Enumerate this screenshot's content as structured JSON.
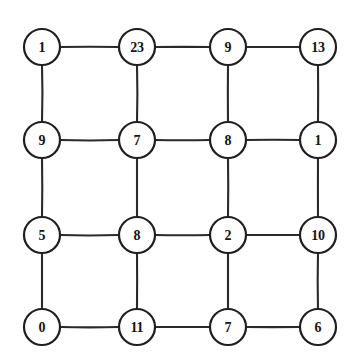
{
  "figure": {
    "type": "grid-graph",
    "title": "",
    "background_color": "#ffffff",
    "node_stroke_color": "#1f1f1f",
    "node_fill_color": "#ffffff",
    "edge_color": "#2a2a2a",
    "label_color": "#141414",
    "rows": 4,
    "columns": 4,
    "node_radius": 18,
    "column_x": [
      42,
      137,
      228,
      318
    ],
    "row_y": [
      47,
      140,
      235,
      327
    ]
  },
  "graph_data": {
    "type": "lattice",
    "node_count": 16,
    "edge_count": 24,
    "nodes": [
      {
        "id": "n-0-0",
        "row": 0,
        "col": 0,
        "label": "1",
        "cx": 42,
        "cy": 47
      },
      {
        "id": "n-0-1",
        "row": 0,
        "col": 1,
        "label": "23",
        "cx": 137,
        "cy": 47
      },
      {
        "id": "n-0-2",
        "row": 0,
        "col": 2,
        "label": "9",
        "cx": 228,
        "cy": 47
      },
      {
        "id": "n-0-3",
        "row": 0,
        "col": 3,
        "label": "13",
        "cx": 318,
        "cy": 47
      },
      {
        "id": "n-1-0",
        "row": 1,
        "col": 0,
        "label": "9",
        "cx": 42,
        "cy": 140
      },
      {
        "id": "n-1-1",
        "row": 1,
        "col": 1,
        "label": "7",
        "cx": 137,
        "cy": 140
      },
      {
        "id": "n-1-2",
        "row": 1,
        "col": 2,
        "label": "8",
        "cx": 228,
        "cy": 140
      },
      {
        "id": "n-1-3",
        "row": 1,
        "col": 3,
        "label": "1",
        "cx": 318,
        "cy": 140
      },
      {
        "id": "n-2-0",
        "row": 2,
        "col": 0,
        "label": "5",
        "cx": 42,
        "cy": 235
      },
      {
        "id": "n-2-1",
        "row": 2,
        "col": 1,
        "label": "8",
        "cx": 137,
        "cy": 235
      },
      {
        "id": "n-2-2",
        "row": 2,
        "col": 2,
        "label": "2",
        "cx": 228,
        "cy": 235
      },
      {
        "id": "n-2-3",
        "row": 2,
        "col": 3,
        "label": "10",
        "cx": 318,
        "cy": 235
      },
      {
        "id": "n-3-0",
        "row": 3,
        "col": 0,
        "label": "0",
        "cx": 42,
        "cy": 327
      },
      {
        "id": "n-3-1",
        "row": 3,
        "col": 1,
        "label": "11",
        "cx": 137,
        "cy": 327
      },
      {
        "id": "n-3-2",
        "row": 3,
        "col": 2,
        "label": "7",
        "cx": 228,
        "cy": 327
      },
      {
        "id": "n-3-3",
        "row": 3,
        "col": 3,
        "label": "6",
        "cx": 318,
        "cy": 327
      }
    ],
    "edges": [
      {
        "from": "n-0-0",
        "to": "n-0-1",
        "orientation": "horizontal"
      },
      {
        "from": "n-0-1",
        "to": "n-0-2",
        "orientation": "horizontal"
      },
      {
        "from": "n-0-2",
        "to": "n-0-3",
        "orientation": "horizontal"
      },
      {
        "from": "n-1-0",
        "to": "n-1-1",
        "orientation": "horizontal"
      },
      {
        "from": "n-1-1",
        "to": "n-1-2",
        "orientation": "horizontal"
      },
      {
        "from": "n-1-2",
        "to": "n-1-3",
        "orientation": "horizontal"
      },
      {
        "from": "n-2-0",
        "to": "n-2-1",
        "orientation": "horizontal"
      },
      {
        "from": "n-2-1",
        "to": "n-2-2",
        "orientation": "horizontal"
      },
      {
        "from": "n-2-2",
        "to": "n-2-3",
        "orientation": "horizontal"
      },
      {
        "from": "n-3-0",
        "to": "n-3-1",
        "orientation": "horizontal"
      },
      {
        "from": "n-3-1",
        "to": "n-3-2",
        "orientation": "horizontal"
      },
      {
        "from": "n-3-2",
        "to": "n-3-3",
        "orientation": "horizontal"
      },
      {
        "from": "n-0-0",
        "to": "n-1-0",
        "orientation": "vertical"
      },
      {
        "from": "n-1-0",
        "to": "n-2-0",
        "orientation": "vertical"
      },
      {
        "from": "n-2-0",
        "to": "n-3-0",
        "orientation": "vertical"
      },
      {
        "from": "n-0-1",
        "to": "n-1-1",
        "orientation": "vertical"
      },
      {
        "from": "n-1-1",
        "to": "n-2-1",
        "orientation": "vertical"
      },
      {
        "from": "n-2-1",
        "to": "n-3-1",
        "orientation": "vertical"
      },
      {
        "from": "n-0-2",
        "to": "n-1-2",
        "orientation": "vertical"
      },
      {
        "from": "n-1-2",
        "to": "n-2-2",
        "orientation": "vertical"
      },
      {
        "from": "n-2-2",
        "to": "n-3-2",
        "orientation": "vertical"
      },
      {
        "from": "n-0-3",
        "to": "n-1-3",
        "orientation": "vertical"
      },
      {
        "from": "n-1-3",
        "to": "n-2-3",
        "orientation": "vertical"
      },
      {
        "from": "n-2-3",
        "to": "n-3-3",
        "orientation": "vertical"
      }
    ]
  }
}
